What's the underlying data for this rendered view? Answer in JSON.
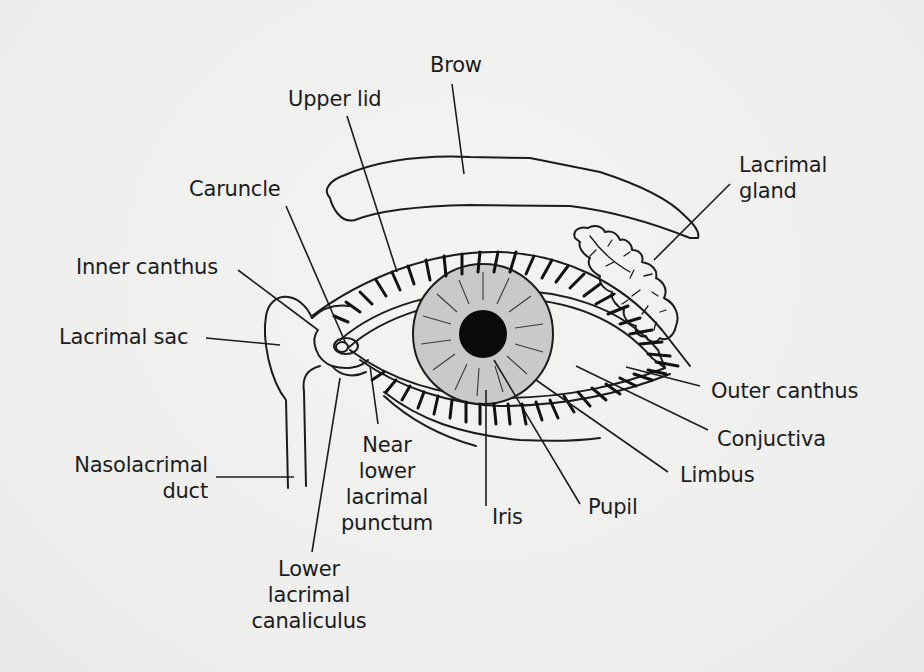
{
  "figure": {
    "colors": {
      "ink": "#1c1c1c",
      "iris_fill": "#c9c9c9",
      "pupil_fill": "#0a0a0a",
      "background": "#f1f1f0"
    }
  },
  "labels": {
    "brow": "Brow",
    "upper_lid": "Upper lid",
    "lacrimal_gland": "Lacrimal\ngland",
    "caruncle": "Caruncle",
    "inner_canthus": "Inner canthus",
    "lacrimal_sac": "Lacrimal sac",
    "outer_canthus": "Outer canthus",
    "conjuctiva": "Conjuctiva",
    "limbus": "Limbus",
    "nasolacrimal_duct": "Nasolacrimal\nduct",
    "near_lower_lacrimal_punctum": "Near\nlower\nlacrimal\npunctum",
    "iris": "Iris",
    "pupil": "Pupil",
    "lower_lacrimal_canaliculus": "Lower\nlacrimal\ncanaliculus"
  }
}
